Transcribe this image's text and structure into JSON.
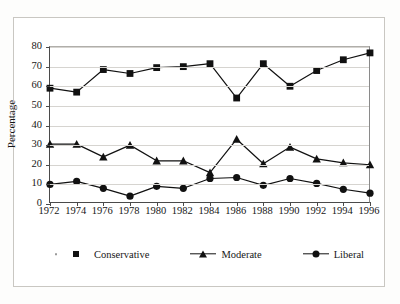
{
  "chart_data": {
    "type": "line",
    "title": "",
    "xlabel": "",
    "ylabel": "Percentage",
    "ylim": [
      0,
      80
    ],
    "yticks": [
      0,
      10,
      20,
      30,
      40,
      50,
      60,
      70,
      80
    ],
    "grid": true,
    "legend_position": "bottom",
    "categories": [
      "1972",
      "1974",
      "1976",
      "1978",
      "1980",
      "1982",
      "1984",
      "1986",
      "1988",
      "1990",
      "1992",
      "1994",
      "1996"
    ],
    "series": [
      {
        "name": "Conservative",
        "marker": "square",
        "color": "#111111",
        "values": [
          59,
          57,
          68.5,
          66.5,
          69.5,
          70,
          71.5,
          54,
          71.5,
          60,
          68,
          73.5,
          77
        ]
      },
      {
        "name": "Moderate",
        "marker": "triangle",
        "color": "#111111",
        "values": [
          30.5,
          30.5,
          24,
          30,
          22,
          22,
          16,
          33,
          20.5,
          29,
          23,
          21,
          20
        ]
      },
      {
        "name": "Liberal",
        "marker": "circle",
        "color": "#111111",
        "values": [
          10,
          11.5,
          8,
          4,
          9,
          8,
          13,
          13.5,
          9.5,
          13,
          10.5,
          7.5,
          5.5
        ]
      }
    ]
  },
  "axis": {
    "y_title": "Percentage",
    "y_tick_labels": [
      "80",
      "70",
      "60",
      "50",
      "40",
      "30",
      "20",
      "10",
      "0"
    ],
    "x_tick_labels": [
      "1972",
      "1974",
      "1976",
      "1978",
      "1980",
      "1982",
      "1984",
      "1986",
      "1988",
      "1990",
      "1992",
      "1994",
      "1996"
    ]
  },
  "legend": {
    "items": [
      {
        "label": "Conservative",
        "marker": "square"
      },
      {
        "label": "Moderate",
        "marker": "triangle"
      },
      {
        "label": "Liberal",
        "marker": "circle"
      }
    ]
  }
}
